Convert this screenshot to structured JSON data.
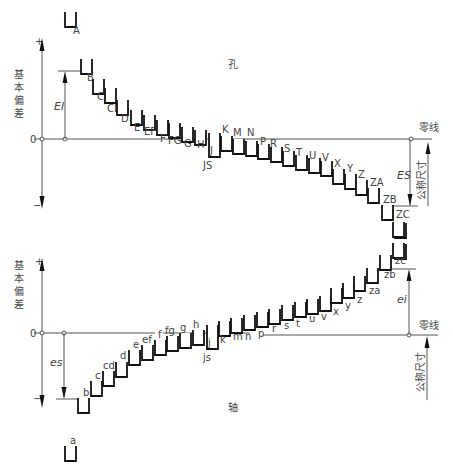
{
  "title_hole": "孔",
  "title_shaft": "轴",
  "axis_label": "基本偏差",
  "zero_label": "0",
  "plus": "+",
  "minus": "−",
  "zero_line_label": "零线",
  "nominal_size_label": "公称尺寸",
  "hole": {
    "ei_label": "EI",
    "es_label": "ES",
    "zero_y": 139,
    "items": [
      {
        "label": "A",
        "x": 65,
        "y": 12,
        "lx": 73,
        "ly": 34
      },
      {
        "label": "B",
        "x": 81,
        "y": 59,
        "lx": 87,
        "ly": 81
      },
      {
        "label": "C",
        "x": 93,
        "y": 79,
        "lx": 97,
        "ly": 100
      },
      {
        "label": "CD",
        "x": 105,
        "y": 88,
        "lx": 107,
        "ly": 112
      },
      {
        "label": "D",
        "x": 117,
        "y": 100,
        "lx": 121,
        "ly": 122
      },
      {
        "label": "E",
        "x": 131,
        "y": 110,
        "lx": 134,
        "ly": 131
      },
      {
        "label": "EF",
        "x": 144,
        "y": 115,
        "lx": 144,
        "ly": 135
      },
      {
        "label": "F",
        "x": 157,
        "y": 120,
        "lx": 160,
        "ly": 142
      },
      {
        "label": "FG",
        "x": 169,
        "y": 123,
        "lx": 168,
        "ly": 144
      },
      {
        "label": "G",
        "x": 182,
        "y": 127,
        "lx": 184,
        "ly": 147
      },
      {
        "label": "H",
        "x": 195,
        "y": 130,
        "lx": 197,
        "ly": 148
      },
      {
        "label": "J",
        "x": 209,
        "y": 133,
        "lx": 210,
        "ly": 154,
        "tall": true
      },
      {
        "label": "K",
        "x": 221,
        "y": 136,
        "lx": 222,
        "ly": 133
      },
      {
        "label": "M",
        "x": 233,
        "y": 139,
        "lx": 233,
        "ly": 136
      },
      {
        "label": "N",
        "x": 246,
        "y": 141,
        "lx": 247,
        "ly": 136
      },
      {
        "label": "P",
        "x": 258,
        "y": 144,
        "lx": 260,
        "ly": 145
      },
      {
        "label": "R",
        "x": 271,
        "y": 147,
        "lx": 270,
        "ly": 147
      },
      {
        "label": "S",
        "x": 283,
        "y": 151,
        "lx": 284,
        "ly": 152
      },
      {
        "label": "T",
        "x": 296,
        "y": 155,
        "lx": 296,
        "ly": 156
      },
      {
        "label": "U",
        "x": 309,
        "y": 158,
        "lx": 309,
        "ly": 159
      },
      {
        "label": "V",
        "x": 321,
        "y": 161,
        "lx": 322,
        "ly": 161
      },
      {
        "label": "X",
        "x": 333,
        "y": 169,
        "lx": 334,
        "ly": 167
      },
      {
        "label": "Y",
        "x": 345,
        "y": 174,
        "lx": 347,
        "ly": 172
      },
      {
        "label": "Z",
        "x": 356,
        "y": 180,
        "lx": 358,
        "ly": 178
      },
      {
        "label": "ZA",
        "x": 368,
        "y": 188,
        "lx": 370,
        "ly": 186
      },
      {
        "label": "ZB",
        "x": 382,
        "y": 205,
        "lx": 383,
        "ly": 203
      },
      {
        "label": "ZC",
        "x": 395,
        "y": 223,
        "lx": 396,
        "ly": 218
      },
      {
        "label": "ZC",
        "x": 395,
        "y": 244,
        "lx": 0,
        "ly": 0,
        "nolabel": true
      }
    ],
    "js_label": "JS"
  },
  "shaft": {
    "es_label": "es",
    "ei_label": "ei",
    "zero_y": 333,
    "items": [
      {
        "label": "a",
        "x": 65,
        "y": 446,
        "lx": 70,
        "ly": 444
      },
      {
        "label": "b",
        "x": 78,
        "y": 398,
        "lx": 83,
        "ly": 396
      },
      {
        "label": "c",
        "x": 91,
        "y": 381,
        "lx": 95,
        "ly": 379
      },
      {
        "label": "cd",
        "x": 103,
        "y": 371,
        "lx": 103,
        "ly": 369
      },
      {
        "label": "d",
        "x": 116,
        "y": 362,
        "lx": 120,
        "ly": 359
      },
      {
        "label": "e",
        "x": 129,
        "y": 350,
        "lx": 133,
        "ly": 348
      },
      {
        "label": "ef",
        "x": 142,
        "y": 345,
        "lx": 142,
        "ly": 343
      },
      {
        "label": "f",
        "x": 155,
        "y": 340,
        "lx": 158,
        "ly": 338
      },
      {
        "label": "fg",
        "x": 167,
        "y": 336,
        "lx": 165,
        "ly": 334
      },
      {
        "label": "g",
        "x": 180,
        "y": 333,
        "lx": 180,
        "ly": 331
      },
      {
        "label": "h",
        "x": 193,
        "y": 330,
        "lx": 193,
        "ly": 328
      },
      {
        "label": "j",
        "x": 207,
        "y": 325,
        "lx": 208,
        "ly": 346,
        "tall": true
      },
      {
        "label": "k",
        "x": 219,
        "y": 321,
        "lx": 220,
        "ly": 343
      },
      {
        "label": "m",
        "x": 231,
        "y": 318,
        "lx": 233,
        "ly": 340
      },
      {
        "label": "n",
        "x": 244,
        "y": 315,
        "lx": 245,
        "ly": 340
      },
      {
        "label": "p",
        "x": 257,
        "y": 312,
        "lx": 258,
        "ly": 337
      },
      {
        "label": "r",
        "x": 269,
        "y": 309,
        "lx": 272,
        "ly": 332
      },
      {
        "label": "s",
        "x": 282,
        "y": 305,
        "lx": 284,
        "ly": 329
      },
      {
        "label": "t",
        "x": 295,
        "y": 302,
        "lx": 296,
        "ly": 327
      },
      {
        "label": "u",
        "x": 307,
        "y": 299,
        "lx": 309,
        "ly": 322
      },
      {
        "label": "v",
        "x": 320,
        "y": 296,
        "lx": 321,
        "ly": 320
      },
      {
        "label": "x",
        "x": 331,
        "y": 288,
        "lx": 333,
        "ly": 315
      },
      {
        "label": "y",
        "x": 343,
        "y": 283,
        "lx": 345,
        "ly": 309
      },
      {
        "label": "z",
        "x": 354,
        "y": 276,
        "lx": 357,
        "ly": 303
      },
      {
        "label": "za",
        "x": 367,
        "y": 268,
        "lx": 369,
        "ly": 294
      },
      {
        "label": "zb",
        "x": 380,
        "y": 255,
        "lx": 384,
        "ly": 278
      },
      {
        "label": "zc",
        "x": 393,
        "y": 243,
        "lx": 395,
        "ly": 264
      },
      {
        "label": "zc",
        "x": 393,
        "y": 222,
        "lx": 0,
        "ly": 0,
        "nolabel": true
      }
    ],
    "js_label": "js"
  }
}
